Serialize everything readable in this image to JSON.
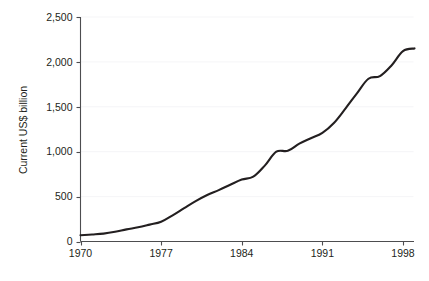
{
  "chart_data": {
    "type": "line",
    "title": "",
    "subtitle": "",
    "xlabel": "",
    "ylabel": "Current US$ billion",
    "xlim": [
      1970,
      1999
    ],
    "ylim": [
      0,
      2500
    ],
    "grid": true,
    "legend": "none",
    "x_tick_labels": [
      "1970",
      "1977",
      "1984",
      "1991",
      "1998"
    ],
    "x_tick_values": [
      1970,
      1977,
      1984,
      1991,
      1998
    ],
    "y_tick_labels": [
      "0",
      "500",
      "1,000",
      "1,500",
      "2,000",
      "2,500"
    ],
    "y_tick_values": [
      0,
      500,
      1000,
      1500,
      2000,
      2500
    ],
    "series": [
      {
        "name": "Current US$ billion",
        "color": "#231f20",
        "x": [
          1970,
          1971,
          1972,
          1973,
          1974,
          1975,
          1976,
          1977,
          1978,
          1979,
          1980,
          1981,
          1982,
          1983,
          1984,
          1985,
          1986,
          1987,
          1988,
          1989,
          1990,
          1991,
          1992,
          1993,
          1994,
          1995,
          1996,
          1997,
          1998,
          1999
        ],
        "values": [
          70,
          78,
          88,
          108,
          135,
          158,
          188,
          220,
          292,
          372,
          450,
          518,
          572,
          632,
          690,
          722,
          845,
          1000,
          1010,
          1090,
          1150,
          1210,
          1320,
          1480,
          1650,
          1812,
          1842,
          1960,
          2120,
          2150
        ]
      }
    ],
    "annotations": []
  },
  "caption": {
    "text": ""
  },
  "axes": {
    "y_axis_name": "y-axis",
    "x_axis_name": "x-axis"
  }
}
